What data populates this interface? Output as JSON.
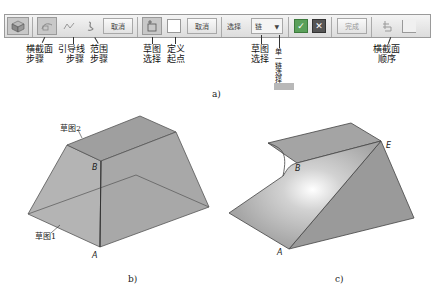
{
  "toolbar": {
    "cancel_label_1": "取消",
    "cancel_label_2": "取消",
    "select_label": "选择",
    "select_value": "链",
    "finish_label": "完成",
    "icons": [
      "part-icon",
      "cross-section-step-icon",
      "guide-line-step-icon",
      "range-step-icon",
      "sketch-select-icon",
      "define-start-point-icon",
      "confirm-icon",
      "close-icon",
      "cross-section-order-icon",
      "cross-section-order-alt-icon"
    ]
  },
  "annotations": {
    "cross_section_step": [
      "横截面",
      "步骤"
    ],
    "guide_line_step": [
      "引导线",
      "步骤"
    ],
    "range_step": [
      "范围",
      "步骤"
    ],
    "sketch_select": [
      "草图",
      "选择"
    ],
    "define_start": [
      "定义",
      "起点"
    ],
    "sketch_select_2": [
      "草图",
      "选择"
    ],
    "single_chain_select": "单一链选择",
    "cross_section_order": [
      "横截面",
      "顺序"
    ]
  },
  "captions": {
    "a": "a)",
    "b": "b)",
    "c": "c)"
  },
  "figure_b": {
    "sketch2_label": "草图2",
    "sketch1_label": "草图1",
    "point_a": "A",
    "point_b": "B"
  },
  "figure_c": {
    "point_a": "A",
    "point_b": "B",
    "point_e": "E"
  },
  "colors": {
    "confirm_green": "#5aa05a",
    "close_dark": "#555555",
    "shape_gray": "#a6a6a6"
  }
}
